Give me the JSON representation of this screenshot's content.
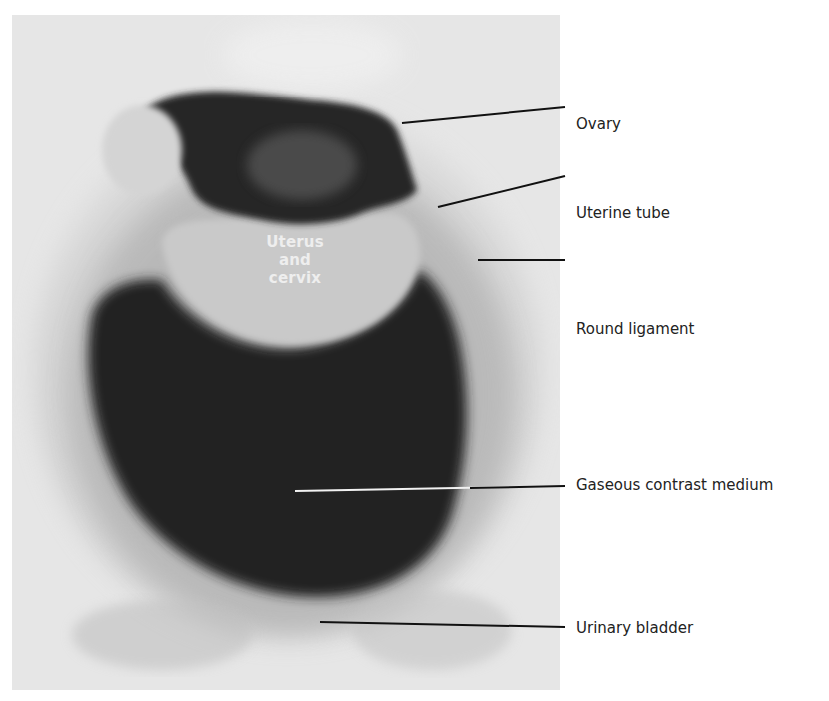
{
  "figure": {
    "type": "radiograph",
    "inner_label": {
      "lines": [
        "Uterus",
        "and",
        "cervix"
      ]
    },
    "labels": [
      {
        "id": "ovary",
        "text": "Ovary",
        "x": 577,
        "y": 115,
        "line": [
          402,
          107,
          565,
          92
        ]
      },
      {
        "id": "uterine-tube",
        "text": "Uterine tube",
        "x": 577,
        "y": 204,
        "line": [
          438,
          192,
          565,
          161
        ]
      },
      {
        "id": "round-ligament",
        "text": "Round ligament",
        "x": 577,
        "y": 320,
        "line": [
          478,
          245,
          565,
          245
        ]
      },
      {
        "id": "gaseous-contrast-medium",
        "text": "Gaseous contrast medium",
        "x": 577,
        "y": 476,
        "line": [
          295,
          366,
          565,
          361
        ]
      },
      {
        "id": "urinary-bladder",
        "text": "Urinary bladder",
        "x": 577,
        "y": 619,
        "line": [
          320,
          464,
          565,
          466
        ]
      }
    ]
  },
  "colors": {
    "leader_line": "#111111",
    "label_text": "#222222",
    "dark_gas": "#1e1e1e"
  }
}
